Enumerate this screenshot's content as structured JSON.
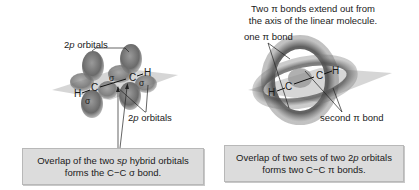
{
  "left_panel": {
    "top_label": "2p orbitals",
    "top_label_prefix": "2",
    "top_label_italic": "p",
    "top_label_suffix": " orbitals",
    "bottom_label_prefix": "2",
    "bottom_label_italic": "p",
    "bottom_label_suffix": " orbitals",
    "atoms": {
      "h_left": "H",
      "c_left": "C",
      "c_right": "C",
      "h_right": "H"
    },
    "sigma_labels": {
      "cc": "σ",
      "ch_left": "σ",
      "ch_right": "σ"
    },
    "caption": {
      "line1_prefix": "Overlap of the two ",
      "line1_italic": "sp",
      "line1_suffix": " hybrid orbitals",
      "line2": "forms the C−C σ bond."
    }
  },
  "right_panel": {
    "header_line1": "Two π bonds extend out from",
    "header_line2": "the axis of the linear molecule.",
    "one_pi_label": "one π bond",
    "second_pi_label": "second π bond",
    "atoms": {
      "h_left": "H",
      "c_left": "C",
      "c_right": "C",
      "h_right": "H"
    },
    "caption": {
      "line1_prefix": "Overlap of two sets of two 2",
      "line1_italic": "p",
      "line1_suffix": " orbitals",
      "line2": "forms two C−C π bonds."
    }
  },
  "colors": {
    "caption_box_fill": "#dcdcdc",
    "orbital_gray": "#6e6e6e",
    "plane_gray": "#c8c8c8"
  }
}
